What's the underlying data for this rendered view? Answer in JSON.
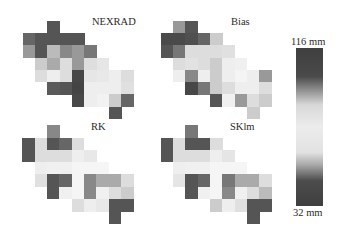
{
  "chart_data": {
    "type": "heatmap",
    "title": "",
    "colorbar": {
      "max_label": "116 mm",
      "min_label": "32 mm",
      "max": 116,
      "min": 32,
      "gradient": [
        {
          "stop": 0,
          "color": "#3f3f3f"
        },
        {
          "stop": 18,
          "color": "#4a4a4a"
        },
        {
          "stop": 26,
          "color": "#8a8a8a"
        },
        {
          "stop": 36,
          "color": "#d8d8d8"
        },
        {
          "stop": 50,
          "color": "#ececec"
        },
        {
          "stop": 66,
          "color": "#e2e2e2"
        },
        {
          "stop": 74,
          "color": "#a8a8a8"
        },
        {
          "stop": 84,
          "color": "#4c4c4c"
        },
        {
          "stop": 100,
          "color": "#3f3f3f"
        }
      ]
    },
    "panels": [
      {
        "name": "NEXRAD",
        "cells": [
          [
            0,
            2,
            "#555555"
          ],
          [
            1,
            0,
            "#666666"
          ],
          [
            1,
            1,
            "#555555"
          ],
          [
            1,
            2,
            "#555555"
          ],
          [
            1,
            3,
            "#555555"
          ],
          [
            1,
            4,
            "#555555"
          ],
          [
            2,
            0,
            "#999999"
          ],
          [
            2,
            1,
            "#555555"
          ],
          [
            2,
            2,
            "#bbbbbb"
          ],
          [
            2,
            3,
            "#888888"
          ],
          [
            2,
            4,
            "#999999"
          ],
          [
            2,
            5,
            "#777777"
          ],
          [
            3,
            1,
            "#cccccc"
          ],
          [
            3,
            2,
            "#aaaaaa"
          ],
          [
            3,
            3,
            "#dddddd"
          ],
          [
            3,
            4,
            "#999999"
          ],
          [
            3,
            5,
            "#dedede"
          ],
          [
            3,
            6,
            "#e6e6e6"
          ],
          [
            4,
            1,
            "#dddddd"
          ],
          [
            4,
            2,
            "#eeeeee"
          ],
          [
            4,
            3,
            "#dddddd"
          ],
          [
            4,
            4,
            "#474747"
          ],
          [
            4,
            5,
            "#e6e6e6"
          ],
          [
            4,
            6,
            "#e8e8e8"
          ],
          [
            4,
            7,
            "#eeeeee"
          ],
          [
            4,
            8,
            "#dddddd"
          ],
          [
            5,
            2,
            "#5a5a5a"
          ],
          [
            5,
            3,
            "#555555"
          ],
          [
            5,
            4,
            "#444444"
          ],
          [
            5,
            5,
            "#eeeeee"
          ],
          [
            5,
            6,
            "#eeeeee"
          ],
          [
            5,
            7,
            "#eeeeee"
          ],
          [
            5,
            8,
            "#e0e0e0"
          ],
          [
            6,
            4,
            "#484848"
          ],
          [
            6,
            5,
            "#eeeeee"
          ],
          [
            6,
            6,
            "#f2f2f2"
          ],
          [
            6,
            7,
            "#cccccc"
          ],
          [
            6,
            8,
            "#666666"
          ],
          [
            7,
            7,
            "#555555"
          ]
        ]
      },
      {
        "name": "Bias",
        "cells": [
          [
            0,
            1,
            "#999999"
          ],
          [
            0,
            2,
            "#555555"
          ],
          [
            1,
            0,
            "#4a4a4a"
          ],
          [
            1,
            1,
            "#4a4a4a"
          ],
          [
            1,
            2,
            "#505050"
          ],
          [
            1,
            3,
            "#666666"
          ],
          [
            1,
            4,
            "#cccccc"
          ],
          [
            2,
            0,
            "#555555"
          ],
          [
            2,
            1,
            "#777777"
          ],
          [
            2,
            2,
            "#dddddd"
          ],
          [
            2,
            3,
            "#dddddd"
          ],
          [
            2,
            4,
            "#dddddd"
          ],
          [
            2,
            5,
            "#e0e0e0"
          ],
          [
            3,
            1,
            "#dddddd"
          ],
          [
            3,
            2,
            "#e2e2e2"
          ],
          [
            3,
            3,
            "#dddddd"
          ],
          [
            3,
            4,
            "#cccccc"
          ],
          [
            3,
            5,
            "#eeeeee"
          ],
          [
            3,
            6,
            "#f0f0f0"
          ],
          [
            4,
            1,
            "#eeeeee"
          ],
          [
            4,
            2,
            "#888888"
          ],
          [
            4,
            3,
            "#eeeeee"
          ],
          [
            4,
            4,
            "#cccccc"
          ],
          [
            4,
            5,
            "#eeeeee"
          ],
          [
            4,
            6,
            "#f4f4f4"
          ],
          [
            4,
            7,
            "#eeeeee"
          ],
          [
            4,
            8,
            "#999999"
          ],
          [
            5,
            2,
            "#474747"
          ],
          [
            5,
            3,
            "#777777"
          ],
          [
            5,
            4,
            "#cccccc"
          ],
          [
            5,
            5,
            "#dddddd"
          ],
          [
            5,
            6,
            "#eeeeee"
          ],
          [
            5,
            7,
            "#eeeeee"
          ],
          [
            5,
            8,
            "#dddddd"
          ],
          [
            6,
            4,
            "#555555"
          ],
          [
            6,
            5,
            "#f0f0f0"
          ],
          [
            6,
            6,
            "#999999"
          ],
          [
            6,
            7,
            "#dddddd"
          ],
          [
            6,
            8,
            "#cccccc"
          ],
          [
            7,
            7,
            "#cccccc"
          ]
        ]
      },
      {
        "name": "RK",
        "cells": [
          [
            0,
            2,
            "#888888"
          ],
          [
            1,
            0,
            "#555555"
          ],
          [
            1,
            1,
            "#dddddd"
          ],
          [
            1,
            2,
            "#555555"
          ],
          [
            1,
            3,
            "#666666"
          ],
          [
            1,
            4,
            "#dddddd"
          ],
          [
            2,
            0,
            "#555555"
          ],
          [
            2,
            1,
            "#dddddd"
          ],
          [
            2,
            2,
            "#dddddd"
          ],
          [
            2,
            3,
            "#dddddd"
          ],
          [
            2,
            4,
            "#eeeeee"
          ],
          [
            2,
            5,
            "#e8e8e8"
          ],
          [
            3,
            1,
            "#eeeeee"
          ],
          [
            3,
            2,
            "#f0f0f0"
          ],
          [
            3,
            3,
            "#f0f0f0"
          ],
          [
            3,
            4,
            "#f5f5f5"
          ],
          [
            3,
            5,
            "#f5f5f5"
          ],
          [
            3,
            6,
            "#f5f5f5"
          ],
          [
            4,
            1,
            "#e0e0e0"
          ],
          [
            4,
            2,
            "#555555"
          ],
          [
            4,
            3,
            "#666666"
          ],
          [
            4,
            4,
            "#f5f5f5"
          ],
          [
            4,
            5,
            "#888888"
          ],
          [
            4,
            6,
            "#aaaaaa"
          ],
          [
            4,
            7,
            "#aaaaaa"
          ],
          [
            4,
            8,
            "#dddddd"
          ],
          [
            5,
            2,
            "#555555"
          ],
          [
            5,
            3,
            "#f0f0f0"
          ],
          [
            5,
            4,
            "#f5f5f5"
          ],
          [
            5,
            5,
            "#888888"
          ],
          [
            5,
            6,
            "#f0f0f0"
          ],
          [
            5,
            7,
            "#dddddd"
          ],
          [
            5,
            8,
            "#cccccc"
          ],
          [
            6,
            4,
            "#dddddd"
          ],
          [
            6,
            5,
            "#eeeeee"
          ],
          [
            6,
            6,
            "#e8e8e8"
          ],
          [
            6,
            7,
            "#555555"
          ],
          [
            6,
            8,
            "#555555"
          ],
          [
            7,
            7,
            "#555555"
          ]
        ]
      },
      {
        "name": "SKlm",
        "cells": [
          [
            0,
            2,
            "#777777"
          ],
          [
            1,
            0,
            "#555555"
          ],
          [
            1,
            1,
            "#dddddd"
          ],
          [
            1,
            2,
            "#555555"
          ],
          [
            1,
            3,
            "#555555"
          ],
          [
            1,
            4,
            "#dddddd"
          ],
          [
            2,
            0,
            "#555555"
          ],
          [
            2,
            1,
            "#dddddd"
          ],
          [
            2,
            2,
            "#dddddd"
          ],
          [
            2,
            3,
            "#dddddd"
          ],
          [
            2,
            4,
            "#eeeeee"
          ],
          [
            2,
            5,
            "#e5e5e5"
          ],
          [
            3,
            1,
            "#eeeeee"
          ],
          [
            3,
            2,
            "#f0f0f0"
          ],
          [
            3,
            3,
            "#f0f0f0"
          ],
          [
            3,
            4,
            "#f5f5f5"
          ],
          [
            3,
            5,
            "#f5f5f5"
          ],
          [
            3,
            6,
            "#f5f5f5"
          ],
          [
            4,
            1,
            "#e5e5e5"
          ],
          [
            4,
            2,
            "#555555"
          ],
          [
            4,
            3,
            "#666666"
          ],
          [
            4,
            4,
            "#f5f5f5"
          ],
          [
            4,
            5,
            "#777777"
          ],
          [
            4,
            6,
            "#aaaaaa"
          ],
          [
            4,
            7,
            "#aaaaaa"
          ],
          [
            4,
            8,
            "#dddddd"
          ],
          [
            5,
            2,
            "#555555"
          ],
          [
            5,
            3,
            "#f0f0f0"
          ],
          [
            5,
            4,
            "#f5f5f5"
          ],
          [
            5,
            5,
            "#888888"
          ],
          [
            5,
            6,
            "#f0f0f0"
          ],
          [
            5,
            7,
            "#dddddd"
          ],
          [
            5,
            8,
            "#bbbbbb"
          ],
          [
            6,
            4,
            "#cccccc"
          ],
          [
            6,
            5,
            "#eeeeee"
          ],
          [
            6,
            6,
            "#e0e0e0"
          ],
          [
            6,
            7,
            "#555555"
          ],
          [
            6,
            8,
            "#555555"
          ],
          [
            7,
            7,
            "#555555"
          ]
        ]
      }
    ],
    "legend": {
      "position": "right",
      "type": "continuous-colorbar"
    }
  },
  "labels": {
    "nexrad": "NEXRAD",
    "bias": "Bias",
    "rk": "RK",
    "sklm": "SKlm",
    "cb_max": "116 mm",
    "cb_min": "32 mm"
  }
}
